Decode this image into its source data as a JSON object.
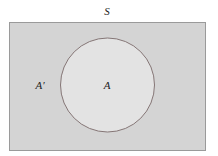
{
  "diagram": {
    "type": "venn",
    "universe_label": "S",
    "set_label": "A",
    "complement_label": "A′",
    "colors": {
      "universe_fill": "#d4d4d4",
      "universe_stroke": "#9a9a9a",
      "set_fill": "#e3e3e3",
      "set_stroke": "#7a6a6a"
    }
  }
}
